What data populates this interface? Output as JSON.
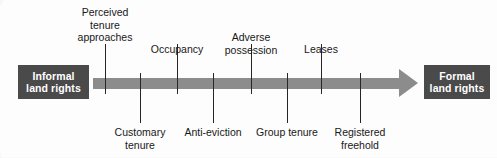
{
  "figure": {
    "colors": {
      "box_fill": "#4a4a4a",
      "box_text": "#ffffff",
      "arrow_fill": "#8c8c8c",
      "tick": "#262626",
      "background": "#fdfdfd"
    }
  },
  "endpoints": {
    "left": {
      "line1": "Informal",
      "line2": "land rights",
      "x": 53
    },
    "right": {
      "line1": "Formal",
      "line2": "land rights",
      "x": 457
    }
  },
  "arrow": {
    "direction": "left-to-right",
    "start_x": 93,
    "end_x": 418,
    "center_y": 83
  },
  "markers": [
    {
      "label_line1": "Perceived",
      "label_line2": "tenure",
      "label_line3": "approaches",
      "lines": 3,
      "side": "top",
      "x": 105
    },
    {
      "label_line1": "Customary",
      "label_line2": "tenure",
      "lines": 2,
      "side": "bottom",
      "x": 140
    },
    {
      "label_line1": "Occupancy",
      "lines": 1,
      "side": "top",
      "x": 177
    },
    {
      "label_line1": "Anti-eviction",
      "lines": 1,
      "side": "bottom",
      "x": 213
    },
    {
      "label_line1": "Adverse",
      "label_line2": "possession",
      "lines": 2,
      "side": "top",
      "x": 251
    },
    {
      "label_line1": "Group tenure",
      "lines": 1,
      "side": "bottom",
      "x": 287
    },
    {
      "label_line1": "Leases",
      "lines": 1,
      "side": "top",
      "x": 321
    },
    {
      "label_line1": "Registered",
      "label_line2": "freehold",
      "lines": 2,
      "side": "bottom",
      "x": 360
    }
  ]
}
